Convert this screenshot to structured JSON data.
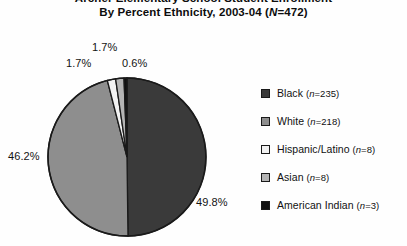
{
  "chart_data": {
    "type": "pie",
    "title": "Archer Elementary School Student Enrollment",
    "subtitle": "By Percent Ethnicity, 2003-04 (N=472)",
    "subtitle_prefix": "By Percent Ethnicity, 2003-04 (",
    "subtitle_italic": "N",
    "subtitle_suffix": "=472)",
    "total_n": 472,
    "categories": [
      "Black",
      "White",
      "Hispanic/Latino",
      "Asian",
      "American Indian"
    ],
    "values": [
      49.8,
      46.2,
      1.7,
      1.7,
      0.6
    ],
    "counts": [
      235,
      218,
      8,
      8,
      3
    ],
    "colors": [
      "#3a3a3a",
      "#8e8e8e",
      "#f2f2f2",
      "#b4b4b4",
      "#111111"
    ],
    "legend_position": "right",
    "grid": false,
    "start_angle_deg": 0,
    "direction": "clockwise",
    "value_suffix": "%"
  },
  "labels": {
    "black_pct": "49.8%",
    "white_pct": "46.2%",
    "hispanic_pct": "1.7%",
    "asian_pct": "1.7%",
    "american_indian_pct": "0.6%"
  },
  "legend": {
    "items": [
      {
        "label": "Black",
        "n_prefix": "(",
        "n_italic": "n",
        "n_value": "=235)",
        "color": "#3a3a3a"
      },
      {
        "label": "White",
        "n_prefix": "(",
        "n_italic": "n",
        "n_value": "=218)",
        "color": "#8e8e8e"
      },
      {
        "label": "Hispanic/Latino",
        "n_prefix": "(",
        "n_italic": "n",
        "n_value": "=8)",
        "color": "#f2f2f2"
      },
      {
        "label": "Asian",
        "n_prefix": "(",
        "n_italic": "n",
        "n_value": "=8)",
        "color": "#b4b4b4"
      },
      {
        "label": "American Indian",
        "n_prefix": "(",
        "n_italic": "n",
        "n_value": "=3)",
        "color": "#111111"
      }
    ]
  }
}
